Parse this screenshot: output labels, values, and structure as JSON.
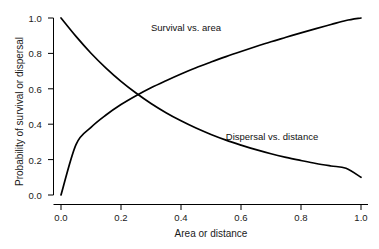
{
  "chart_data": {
    "type": "line",
    "title": "",
    "xlabel": "Area or distance",
    "ylabel": "Probability of survival or dispersal",
    "xlim": [
      0.0,
      1.0
    ],
    "ylim": [
      0.0,
      1.0
    ],
    "xticks": [
      "0.0",
      "0.2",
      "0.4",
      "0.6",
      "0.8",
      "1.0"
    ],
    "yticks": [
      "0.0",
      "0.2",
      "0.4",
      "0.6",
      "0.8",
      "1.0"
    ],
    "xtick_values": [
      0.0,
      0.2,
      0.4,
      0.6,
      0.8,
      1.0
    ],
    "ytick_values": [
      0.0,
      0.2,
      0.4,
      0.6,
      0.8,
      1.0
    ],
    "grid": false,
    "legend": "inline annotations",
    "line_color": "#000000",
    "background_color": "#ffffff",
    "axis_color": "#000000",
    "x": [
      0.0,
      0.05,
      0.1,
      0.15,
      0.2,
      0.25,
      0.3,
      0.35,
      0.4,
      0.45,
      0.5,
      0.55,
      0.6,
      0.65,
      0.7,
      0.75,
      0.8,
      0.85,
      0.9,
      0.95,
      1.0
    ],
    "series": [
      {
        "name": "Survival vs. area",
        "values": [
          0.0,
          0.285,
          0.382,
          0.452,
          0.511,
          0.561,
          0.606,
          0.646,
          0.684,
          0.719,
          0.751,
          0.782,
          0.811,
          0.839,
          0.866,
          0.891,
          0.916,
          0.94,
          0.963,
          0.986,
          1.0
        ],
        "annotation": "Survival vs. area",
        "annotation_x": 0.42,
        "annotation_y": 0.95,
        "endpoint_start": [
          0.0,
          0.0
        ],
        "endpoint_end": [
          1.0,
          1.0
        ]
      },
      {
        "name": "Dispersal vs. distance",
        "values": [
          1.0,
          0.896,
          0.801,
          0.717,
          0.642,
          0.576,
          0.517,
          0.465,
          0.419,
          0.378,
          0.342,
          0.31,
          0.282,
          0.256,
          0.233,
          0.213,
          0.195,
          0.178,
          0.164,
          0.151,
          0.1
        ],
        "annotation": "Dispersal vs. distance",
        "annotation_x": 0.7,
        "annotation_y": 0.39,
        "endpoint_start": [
          0.0,
          1.0
        ],
        "endpoint_end": [
          1.0,
          0.1
        ]
      }
    ],
    "intersection": [
      0.28,
      0.53
    ]
  }
}
